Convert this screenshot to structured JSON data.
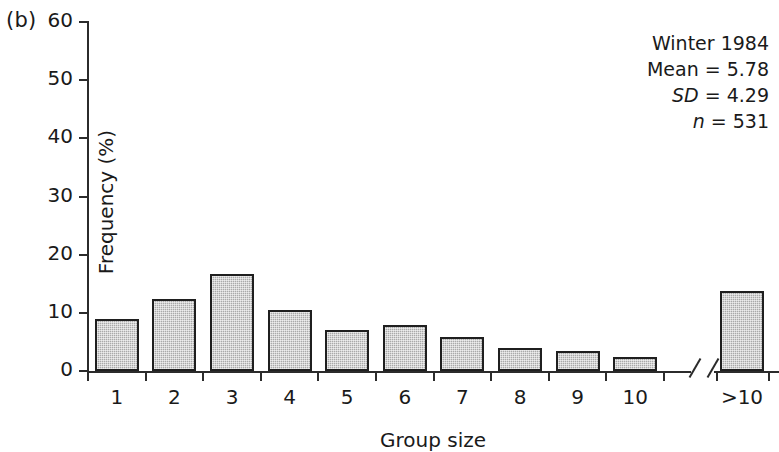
{
  "panel": {
    "label": "(b)"
  },
  "chart_data": {
    "type": "bar",
    "title": "",
    "xlabel": "Group size",
    "ylabel": "Frequency (%)",
    "categories": [
      "1",
      "2",
      "3",
      "4",
      "5",
      "6",
      "7",
      "8",
      "9",
      "10",
      ">10"
    ],
    "values": [
      8.9,
      12.4,
      16.7,
      10.5,
      7.1,
      7.9,
      5.9,
      4.0,
      3.4,
      2.4,
      13.7
    ],
    "ylim": [
      0,
      60
    ],
    "yticks": [
      0,
      10,
      20,
      30,
      40,
      50,
      60
    ],
    "ytick_labels": [
      "0",
      "10",
      "20",
      "30",
      "40",
      "50",
      "60"
    ],
    "grid": false,
    "legend": "none",
    "axis_break": true,
    "annotations": [
      {
        "text": "Winter 1984",
        "italic_part": ""
      },
      {
        "text": "Mean = 5.78",
        "italic_part": ""
      },
      {
        "text": "SD = 4.29",
        "italic_part": "SD"
      },
      {
        "text": "n = 531",
        "italic_part": "n"
      }
    ],
    "bar_fill_color": "#a9a9a9",
    "bar_edge_color": "#1f1f1f",
    "axis_color": "#2b2b2b"
  },
  "annotation": {
    "season_year": "Winter 1984",
    "mean_label": "Mean",
    "mean_value": "= 5.78",
    "sd_label": "SD",
    "sd_value": "= 4.29",
    "n_label": "n",
    "n_value": "= 531"
  }
}
